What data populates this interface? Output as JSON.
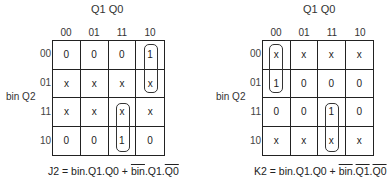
{
  "kmaps": [
    {
      "name": "J2",
      "col_var_label": "Q1 Q0",
      "row_var_label": "bin Q2",
      "col_headers": [
        "00",
        "01",
        "11",
        "10"
      ],
      "row_headers": [
        "00",
        "01",
        "11",
        "10"
      ],
      "cells": [
        [
          "0",
          "0",
          "0",
          "1"
        ],
        [
          "x",
          "x",
          "x",
          "x"
        ],
        [
          "x",
          "x",
          "x",
          "x"
        ],
        [
          "0",
          "0",
          "1",
          "0"
        ]
      ],
      "groups": [
        {
          "rows": [
            0,
            1
          ],
          "col": 3
        },
        {
          "rows": [
            2,
            3
          ],
          "col": 2
        }
      ],
      "equation": {
        "lhs": "J2 = ",
        "term1": "bin.Q1.Q0",
        "plus": " + ",
        "term2_parts": [
          {
            "text": "bin",
            "overline": true
          },
          {
            "text": ".Q1.",
            "overline": false
          },
          {
            "text": "Q0",
            "overline": true
          }
        ]
      }
    },
    {
      "name": "K2",
      "col_var_label": "Q1 Q0",
      "row_var_label": "bin Q2",
      "col_headers": [
        "00",
        "01",
        "11",
        "10"
      ],
      "row_headers": [
        "00",
        "01",
        "11",
        "10"
      ],
      "cells": [
        [
          "x",
          "x",
          "x",
          "x"
        ],
        [
          "1",
          "0",
          "0",
          "0"
        ],
        [
          "0",
          "0",
          "1",
          "0"
        ],
        [
          "x",
          "x",
          "x",
          "x"
        ]
      ],
      "groups": [
        {
          "rows": [
            0,
            1
          ],
          "col": 0
        },
        {
          "rows": [
            2,
            3
          ],
          "col": 2
        }
      ],
      "equation": {
        "lhs": "K2 = ",
        "term1": "bin.Q1.Q0",
        "plus": " + ",
        "term2_parts": [
          {
            "text": "bin",
            "overline": true
          },
          {
            "text": ".",
            "overline": false
          },
          {
            "text": "Q1",
            "overline": true
          },
          {
            "text": ".",
            "overline": false
          },
          {
            "text": "Q0",
            "overline": true
          }
        ]
      }
    }
  ]
}
